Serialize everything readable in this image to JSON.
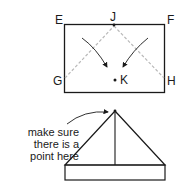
{
  "diagram": {
    "top_figure": {
      "corner_labels": {
        "E": "E",
        "F": "F",
        "G": "G",
        "H": "H",
        "J": "J",
        "K": "K"
      }
    },
    "bottom_figure": {
      "annotation_lines": [
        "make sure",
        "there is a",
        "point here"
      ]
    },
    "colors": {
      "ink": "#1a1a1a",
      "fold_line": "#b8b8b8"
    }
  }
}
